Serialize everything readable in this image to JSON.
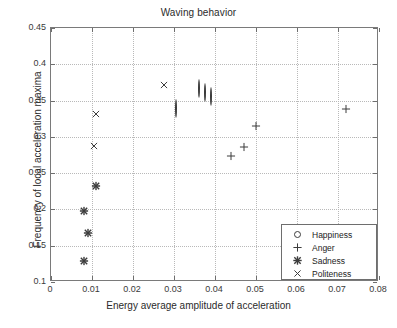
{
  "chart_data": {
    "type": "scatter",
    "title": "Waving behavior",
    "xlabel": "Energy average amplitude of acceleration",
    "ylabel": "Frequency of local acceleration maxima",
    "xlim": [
      0,
      0.08
    ],
    "ylim": [
      0.1,
      0.45
    ],
    "xticks": [
      0,
      0.01,
      0.02,
      0.03,
      0.04,
      0.05,
      0.06,
      0.07,
      0.08
    ],
    "xticklabels": [
      "0",
      "0.01",
      "0.02",
      "0.03",
      "0.04",
      "0.05",
      "0.06",
      "0.07",
      "0.08"
    ],
    "yticks": [
      0.1,
      0.15,
      0.2,
      0.25,
      0.3,
      0.35,
      0.4,
      0.45
    ],
    "yticklabels": [
      "0.1",
      "0.15",
      "0.2",
      "0.25",
      "0.3",
      "0.35",
      "0.4",
      "0.45"
    ],
    "grid": true,
    "grid_style": "dotted",
    "legend_position": "lower right",
    "marker_color": "#3c3c3c",
    "axis_color": "#7a7a7a",
    "grid_color": "#b9b9b9",
    "series": [
      {
        "name": "Happiness",
        "marker": "circle",
        "points": [
          {
            "x": 0.0305,
            "y": 0.338
          },
          {
            "x": 0.036,
            "y": 0.366
          },
          {
            "x": 0.0375,
            "y": 0.361
          },
          {
            "x": 0.039,
            "y": 0.355
          }
        ]
      },
      {
        "name": "Anger",
        "marker": "plus",
        "points": [
          {
            "x": 0.044,
            "y": 0.274
          },
          {
            "x": 0.047,
            "y": 0.286
          },
          {
            "x": 0.05,
            "y": 0.315
          },
          {
            "x": 0.072,
            "y": 0.338
          }
        ]
      },
      {
        "name": "Sadness",
        "marker": "star",
        "points": [
          {
            "x": 0.008,
            "y": 0.129
          },
          {
            "x": 0.009,
            "y": 0.168
          },
          {
            "x": 0.008,
            "y": 0.198
          },
          {
            "x": 0.011,
            "y": 0.232
          }
        ]
      },
      {
        "name": "Politeness",
        "marker": "x",
        "points": [
          {
            "x": 0.0105,
            "y": 0.288
          },
          {
            "x": 0.011,
            "y": 0.331
          },
          {
            "x": 0.0275,
            "y": 0.372
          }
        ]
      }
    ]
  },
  "legend": {
    "entries": [
      {
        "label": "Happiness",
        "marker": "circle"
      },
      {
        "label": "Anger",
        "marker": "plus"
      },
      {
        "label": "Sadness",
        "marker": "star"
      },
      {
        "label": "Politeness",
        "marker": "x"
      }
    ]
  }
}
